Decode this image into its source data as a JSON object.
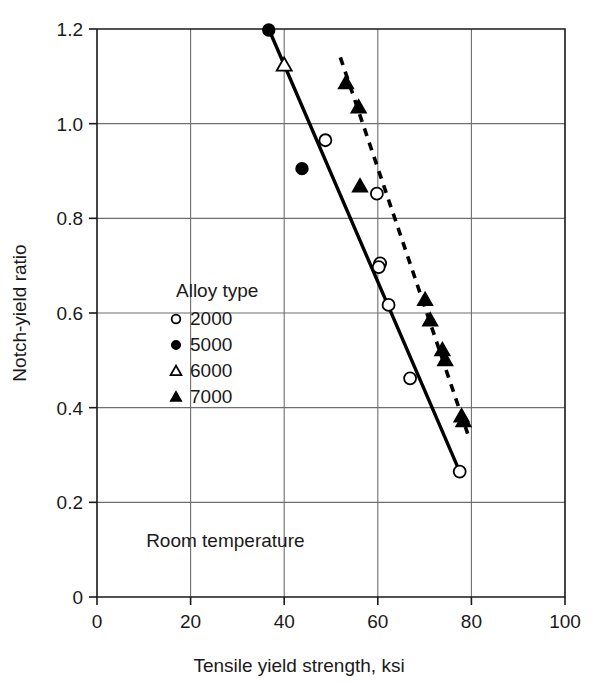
{
  "chart_data": {
    "type": "scatter",
    "title": "",
    "xlabel": "Tensile yield strength, ksi",
    "ylabel": "Notch-yield ratio",
    "xlim": [
      0,
      100
    ],
    "ylim": [
      0,
      1.2
    ],
    "xticks": [
      "0",
      "20",
      "40",
      "60",
      "80",
      "100"
    ],
    "xtick_values": [
      0,
      20,
      40,
      60,
      80,
      100
    ],
    "yticks": [
      "0",
      "0.2",
      "0.4",
      "0.6",
      "0.8",
      "1.0",
      "1.2"
    ],
    "ytick_values": [
      0,
      0.2,
      0.4,
      0.6,
      0.8,
      1.0,
      1.2
    ],
    "grid": true,
    "grid_x_values": [
      20,
      40,
      60,
      80
    ],
    "grid_y_values": [
      0.2,
      0.4,
      0.6,
      0.8,
      1.0
    ],
    "legend_position": "inside-left-middle",
    "annotations": [
      {
        "text": "Room temperature",
        "x": 10.5,
        "y": 0.105
      }
    ],
    "series": [
      {
        "name": "2000",
        "marker": "open-circle",
        "points": [
          {
            "x": 48.8,
            "y": 0.965
          },
          {
            "x": 59.8,
            "y": 0.852
          },
          {
            "x": 60.5,
            "y": 0.705
          },
          {
            "x": 60.2,
            "y": 0.697
          },
          {
            "x": 62.3,
            "y": 0.617
          },
          {
            "x": 66.9,
            "y": 0.462
          },
          {
            "x": 77.5,
            "y": 0.265
          }
        ]
      },
      {
        "name": "5000",
        "marker": "filled-circle",
        "points": [
          {
            "x": 36.7,
            "y": 1.198
          },
          {
            "x": 43.8,
            "y": 0.905
          }
        ]
      },
      {
        "name": "6000",
        "marker": "open-triangle",
        "points": [
          {
            "x": 40.0,
            "y": 1.124
          }
        ]
      },
      {
        "name": "7000",
        "marker": "filled-triangle",
        "points": [
          {
            "x": 53.2,
            "y": 1.086
          },
          {
            "x": 55.9,
            "y": 1.035
          },
          {
            "x": 56.2,
            "y": 0.868
          },
          {
            "x": 70.1,
            "y": 0.628
          },
          {
            "x": 71.2,
            "y": 0.585
          },
          {
            "x": 73.8,
            "y": 0.522
          },
          {
            "x": 74.4,
            "y": 0.501
          },
          {
            "x": 77.9,
            "y": 0.382
          },
          {
            "x": 78.3,
            "y": 0.372
          }
        ]
      }
    ],
    "fit_lines": [
      {
        "name": "solid-trend",
        "style": "solid",
        "x1": 36.7,
        "y1": 1.2,
        "x2": 77.5,
        "y2": 0.265
      },
      {
        "name": "dashed-trend",
        "style": "dashed",
        "x1": 52.0,
        "y1": 1.14,
        "x2": 79.2,
        "y2": 0.345
      }
    ]
  },
  "legend": {
    "title": "Alloy type",
    "entries": [
      {
        "label": "2000",
        "marker": "open-circle"
      },
      {
        "label": "5000",
        "marker": "filled-circle"
      },
      {
        "label": "6000",
        "marker": "open-triangle"
      },
      {
        "label": "7000",
        "marker": "filled-triangle"
      }
    ]
  }
}
